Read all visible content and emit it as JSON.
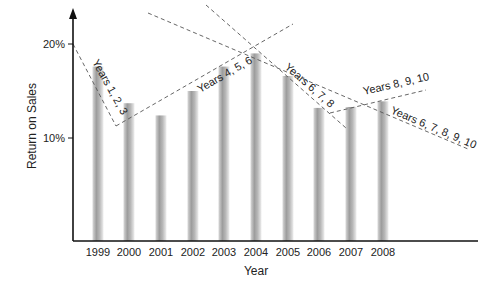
{
  "chart_data": {
    "type": "bar",
    "title": "",
    "xlabel": "Year",
    "ylabel": "Return on Sales",
    "categories": [
      "1999",
      "2000",
      "2001",
      "2002",
      "2003",
      "2004",
      "2005",
      "2006",
      "2007",
      "2008"
    ],
    "values": [
      17.6,
      13.7,
      12.4,
      15.0,
      17.6,
      19.0,
      16.6,
      13.2,
      13.3,
      13.9
    ],
    "unit": "%",
    "y_ticks": [
      {
        "value": 10,
        "label": "10%"
      },
      {
        "value": 20,
        "label": "20%"
      }
    ],
    "ylim": [
      0,
      22
    ],
    "grid": false,
    "legend": null,
    "annotations": [
      {
        "label": "Years 1, 2, 3",
        "type": "dashed-trendline",
        "from": [
          73,
          44
        ],
        "to": [
          116,
          126
        ],
        "label_pos": [
          92,
          62
        ],
        "angle": 61
      },
      {
        "label": "Years 4, 5, 6",
        "type": "dashed-trendline",
        "from": [
          116,
          126
        ],
        "to": [
          293,
          24
        ],
        "label_pos": [
          200,
          93
        ],
        "angle": -30
      },
      {
        "label": "Years 6, 7, 8",
        "type": "dashed-trendline",
        "from": [
          206,
          5
        ],
        "to": [
          346,
          128
        ],
        "label_pos": [
          284,
          68
        ],
        "angle": 41
      },
      {
        "label": "Years 8, 9, 10",
        "type": "dashed-trendline",
        "from": [
          330,
          113
        ],
        "to": [
          426,
          90
        ],
        "label_pos": [
          364,
          95
        ],
        "angle": -13
      },
      {
        "label": "Years 6, 7, 8, 9, 10",
        "type": "dashed-trendline",
        "from": [
          148,
          13
        ],
        "to": [
          468,
          149
        ],
        "label_pos": [
          390,
          113
        ],
        "angle": 23
      }
    ]
  },
  "layout": {
    "axis_x": 73,
    "baseline_y": 241,
    "axis_top_y": 8,
    "axis_right_x": 478,
    "y_at_20": 44,
    "y_at_10": 138,
    "bar_centers": [
      98,
      129,
      161,
      193,
      224,
      256,
      288,
      319,
      351,
      383
    ],
    "bar_width": 11,
    "bar_color_dark": "#9a9a9a",
    "bar_color_light": "#e6e6e6"
  }
}
